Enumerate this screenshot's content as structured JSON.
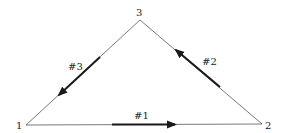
{
  "diagram": {
    "type": "triangle-truss",
    "colors": {
      "edge": "#6a6a6a",
      "member": "#1a1a1a",
      "text": "#222222",
      "background": "#ffffff"
    },
    "nodes": [
      {
        "id": "1",
        "label": "1",
        "x": 26,
        "y": 125
      },
      {
        "id": "2",
        "label": "2",
        "x": 262,
        "y": 124
      },
      {
        "id": "3",
        "label": "3",
        "x": 140,
        "y": 20
      }
    ],
    "edges": [
      {
        "from": "1",
        "to": "2"
      },
      {
        "from": "2",
        "to": "3"
      },
      {
        "from": "3",
        "to": "1"
      }
    ],
    "members": [
      {
        "label": "#1",
        "edge": "1-2",
        "direction": "toward node 2"
      },
      {
        "label": "#2",
        "edge": "2-3",
        "direction": "toward node 3"
      },
      {
        "label": "#3",
        "edge": "3-1",
        "direction": "toward node 1"
      }
    ]
  }
}
